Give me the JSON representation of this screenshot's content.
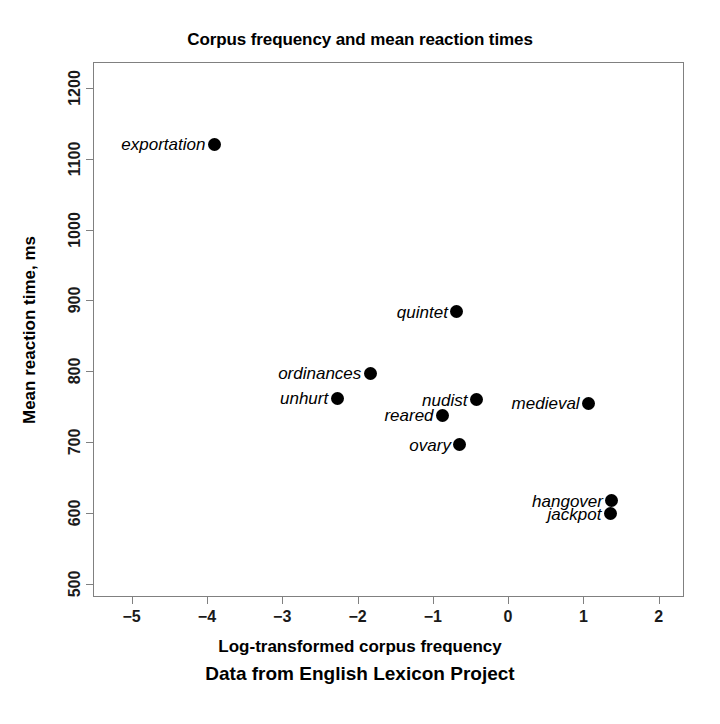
{
  "chart_data": {
    "type": "scatter",
    "title": "Corpus frequency and mean reaction times",
    "xlabel": "Log-transformed corpus frequency",
    "ylabel": "Mean reaction time, ms",
    "caption": "Data from English Lexicon Project",
    "xlim": [
      -5.5,
      2.35
    ],
    "ylim": [
      480,
      1235
    ],
    "xticks": [
      -5,
      -4,
      -3,
      -2,
      -1,
      0,
      1,
      2
    ],
    "xticklabels": [
      "−5",
      "−4",
      "−3",
      "−2",
      "−1",
      "0",
      "1",
      "2"
    ],
    "yticks": [
      500,
      600,
      700,
      800,
      900,
      1000,
      1100,
      1200
    ],
    "yticklabels": [
      "500",
      "600",
      "700",
      "800",
      "900",
      "1000",
      "1100",
      "1200"
    ],
    "grid": false,
    "legend": "none",
    "marker_color": "#000000",
    "frame_color": "#808080",
    "points": [
      {
        "label": "exportation",
        "x": -3.9,
        "y": 1120,
        "label_pos": "left"
      },
      {
        "label": "quintet",
        "x": -0.68,
        "y": 884,
        "label_pos": "left"
      },
      {
        "label": "ordinances",
        "x": -1.83,
        "y": 797,
        "label_pos": "left"
      },
      {
        "label": "unhurt",
        "x": -2.27,
        "y": 762,
        "label_pos": "left"
      },
      {
        "label": "nudist",
        "x": -0.42,
        "y": 760,
        "label_pos": "left"
      },
      {
        "label": "medieval",
        "x": 1.07,
        "y": 755,
        "label_pos": "left"
      },
      {
        "label": "reared",
        "x": -0.87,
        "y": 738,
        "label_pos": "left"
      },
      {
        "label": "ovary",
        "x": -0.64,
        "y": 696,
        "label_pos": "left"
      },
      {
        "label": "hangover",
        "x": 1.38,
        "y": 617,
        "label_pos": "left"
      },
      {
        "label": "jackpot",
        "x": 1.36,
        "y": 599,
        "label_pos": "left"
      }
    ]
  }
}
